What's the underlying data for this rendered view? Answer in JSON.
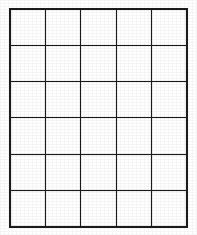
{
  "document": {
    "kind": "blank-grid-worksheet",
    "background_color": "#ffffff",
    "ink_color": "#1b1b1b"
  },
  "grid": {
    "columns": 5,
    "rows": 6,
    "total_cells": 30,
    "line_width_px": 2,
    "cell_width_px": 35,
    "cell_height_px": 36,
    "left_px": 11,
    "top_px": 10,
    "right_px": 186,
    "bottom_px": 226,
    "cells": [
      [
        "",
        "",
        "",
        "",
        ""
      ],
      [
        "",
        "",
        "",
        "",
        ""
      ],
      [
        "",
        "",
        "",
        "",
        ""
      ],
      [
        "",
        "",
        "",
        "",
        ""
      ],
      [
        "",
        "",
        "",
        "",
        ""
      ],
      [
        "",
        "",
        "",
        "",
        ""
      ]
    ]
  }
}
